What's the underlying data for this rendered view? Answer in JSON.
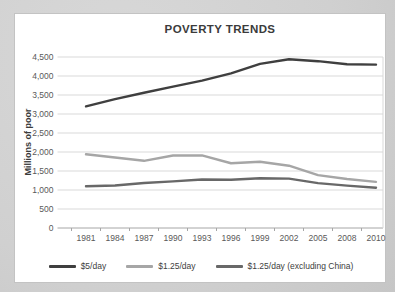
{
  "page": {
    "background": "#d2d2d2"
  },
  "chart_data": {
    "type": "line",
    "title": "POVERTY TRENDS",
    "xlabel": "",
    "ylabel": "Millions of poor",
    "ylim": [
      0,
      4500
    ],
    "ytick_step": 500,
    "grid": true,
    "legend_position": "bottom",
    "categories": [
      "1981",
      "1984",
      "1987",
      "1990",
      "1993",
      "1996",
      "1999",
      "2002",
      "2005",
      "2008",
      "2010"
    ],
    "series": [
      {
        "name": "$5/day",
        "color": "#3f3f3f",
        "values": [
          3200,
          3390,
          3560,
          3720,
          3880,
          4070,
          4320,
          4440,
          4390,
          4310,
          4300
        ]
      },
      {
        "name": "$1.25/day",
        "color": "#a6a6a6",
        "values": [
          1940,
          1856,
          1768,
          1909,
          1910,
          1704,
          1743,
          1639,
          1390,
          1289,
          1215
        ]
      },
      {
        "name": "$1.25/day (excluding China)",
        "color": "#686868",
        "values": [
          1100,
          1120,
          1183,
          1226,
          1276,
          1269,
          1310,
          1300,
          1182,
          1116,
          1060
        ]
      }
    ],
    "colors": {
      "gridline": "#d9d9d9",
      "axis_line": "#a6a6a6",
      "tick_text": "#595959"
    }
  }
}
